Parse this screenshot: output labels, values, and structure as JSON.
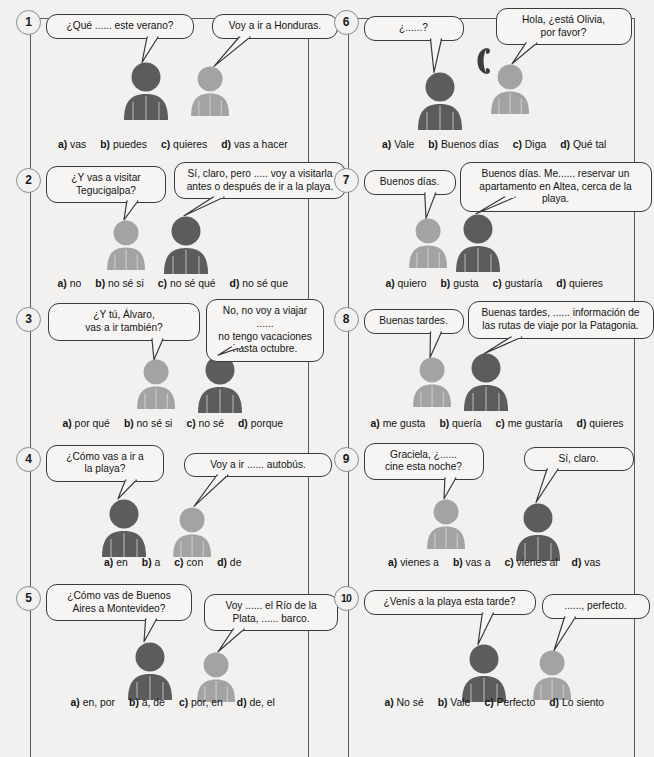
{
  "page": {
    "columns": 2,
    "colors": {
      "background": "#f2f1ef",
      "frame": "#5a5a5a",
      "bubble_border": "#3a3a3a",
      "person_dark": "#5c5c5c",
      "person_light": "#a3a3a3",
      "number_circle_border": "#8a8a8a"
    }
  },
  "items": [
    {
      "number": "1",
      "left_bubble": "¿Qué ...... este verano?",
      "right_bubble": "Voy a ir a Honduras.",
      "left_person": "dark",
      "right_person": "light",
      "has_phone": false,
      "options": [
        {
          "letter": "a)",
          "text": "vas"
        },
        {
          "letter": "b)",
          "text": "puedes"
        },
        {
          "letter": "c)",
          "text": "quieres"
        },
        {
          "letter": "d)",
          "text": "vas a hacer"
        }
      ]
    },
    {
      "number": "2",
      "left_bubble": "¿Y vas a visitar\nTegucigalpa?",
      "right_bubble": "Sí, claro, pero ..... voy a visitarla\nantes o después de ir a la playa.",
      "left_person": "light",
      "right_person": "dark",
      "has_phone": false,
      "options": [
        {
          "letter": "a)",
          "text": "no"
        },
        {
          "letter": "b)",
          "text": "no sé si"
        },
        {
          "letter": "c)",
          "text": "no sé qué"
        },
        {
          "letter": "d)",
          "text": "no sé que"
        }
      ]
    },
    {
      "number": "3",
      "left_bubble": "¿Y tú, Álvaro,\nvas a ir también?",
      "right_bubble": "No, no voy a viajar ......\nno tengo vacaciones\nhasta octubre.",
      "left_person": "light",
      "right_person": "dark",
      "has_phone": false,
      "options": [
        {
          "letter": "a)",
          "text": "por qué"
        },
        {
          "letter": "b)",
          "text": "no sé si"
        },
        {
          "letter": "c)",
          "text": "no sé"
        },
        {
          "letter": "d)",
          "text": "porque"
        }
      ]
    },
    {
      "number": "4",
      "left_bubble": "¿Cómo vas a ir a\nla playa?",
      "right_bubble": "Voy a ir ...... autobús.",
      "left_person": "dark",
      "right_person": "light",
      "has_phone": false,
      "options": [
        {
          "letter": "a)",
          "text": "en"
        },
        {
          "letter": "b)",
          "text": "a"
        },
        {
          "letter": "c)",
          "text": "con"
        },
        {
          "letter": "d)",
          "text": "de"
        }
      ]
    },
    {
      "number": "5",
      "left_bubble": "¿Cómo vas de Buenos\nAires a Montevideo?",
      "right_bubble": "Voy ...... el Río de la\nPlata, ...... barco.",
      "left_person": "dark",
      "right_person": "light",
      "has_phone": false,
      "options": [
        {
          "letter": "a)",
          "text": "en, por"
        },
        {
          "letter": "b)",
          "text": "a, de"
        },
        {
          "letter": "c)",
          "text": "por, en"
        },
        {
          "letter": "d)",
          "text": "de, el"
        }
      ]
    },
    {
      "number": "6",
      "left_bubble": "¿......?",
      "right_bubble": "Hola, ¿está Olivia,\npor favor?",
      "left_person": "dark",
      "right_person": "light",
      "has_phone": true,
      "phone_icon": "telephone-handset-icon",
      "options": [
        {
          "letter": "a)",
          "text": "Vale"
        },
        {
          "letter": "b)",
          "text": "Buenos días"
        },
        {
          "letter": "c)",
          "text": "Diga"
        },
        {
          "letter": "d)",
          "text": "Qué tal"
        }
      ]
    },
    {
      "number": "7",
      "left_bubble": "Buenos días.",
      "right_bubble": "Buenos días. Me...... reservar un\napartamento en Altea, cerca de la playa.",
      "left_person": "light",
      "right_person": "dark",
      "has_phone": false,
      "options": [
        {
          "letter": "a)",
          "text": "quiero"
        },
        {
          "letter": "b)",
          "text": "gusta"
        },
        {
          "letter": "c)",
          "text": "gustaría"
        },
        {
          "letter": "d)",
          "text": "quieres"
        }
      ]
    },
    {
      "number": "8",
      "left_bubble": "Buenas tardes.",
      "right_bubble": "Buenas tardes, ...... información de\nlas rutas de viaje por la Patagonia.",
      "left_person": "light",
      "right_person": "dark",
      "has_phone": false,
      "options": [
        {
          "letter": "a)",
          "text": "me gusta"
        },
        {
          "letter": "b)",
          "text": "quería"
        },
        {
          "letter": "c)",
          "text": "me gustaría"
        },
        {
          "letter": "d)",
          "text": "quieres"
        }
      ]
    },
    {
      "number": "9",
      "left_bubble": "Graciela, ¿......\ncine esta noche?",
      "right_bubble": "Sí, claro.",
      "left_person": "light",
      "right_person": "dark",
      "has_phone": false,
      "options": [
        {
          "letter": "a)",
          "text": "vienes a"
        },
        {
          "letter": "b)",
          "text": "vas a"
        },
        {
          "letter": "c)",
          "text": "vienes al"
        },
        {
          "letter": "d)",
          "text": "vas"
        }
      ]
    },
    {
      "number": "10",
      "left_bubble": "¿Venís a la playa esta tarde?",
      "right_bubble": "......, perfecto.",
      "left_person": "dark",
      "right_person": "light",
      "has_phone": false,
      "options": [
        {
          "letter": "a)",
          "text": "No sé"
        },
        {
          "letter": "b)",
          "text": "Vale"
        },
        {
          "letter": "c)",
          "text": "Perfecto"
        },
        {
          "letter": "d)",
          "text": "Lo siento"
        }
      ]
    }
  ],
  "layout": {
    "item_specs": [
      {
        "lb": {
          "l": 0,
          "t": 14,
          "w": 148,
          "align": "center"
        },
        "rb": {
          "l": 166,
          "t": 14,
          "w": 126
        },
        "ld": {
          "x": 96,
          "y": 62
        },
        "rd": {
          "x": 168,
          "y": 66
        },
        "lp": {
          "x": 72,
          "y": 62,
          "s": 1.0
        },
        "rp": {
          "x": 140,
          "y": 66,
          "s": 0.86
        }
      },
      {
        "lb": {
          "l": 0,
          "t": 8,
          "w": 120
        },
        "rb": {
          "l": 128,
          "t": 4,
          "w": 172
        },
        "ld": {
          "x": 78,
          "y": 62
        },
        "rd": {
          "x": 138,
          "y": 58
        },
        "lp": {
          "x": 56,
          "y": 62,
          "s": 0.86
        },
        "rp": {
          "x": 112,
          "y": 58,
          "s": 1.0
        }
      },
      {
        "lb": {
          "l": 2,
          "t": 6,
          "w": 152
        },
        "rb": {
          "l": 160,
          "t": 2,
          "w": 118
        },
        "ld": {
          "x": 108,
          "y": 62
        },
        "rd": {
          "x": 172,
          "y": 58
        },
        "lp": {
          "x": 86,
          "y": 62,
          "s": 0.86
        },
        "rp": {
          "x": 146,
          "y": 58,
          "s": 1.0
        }
      },
      {
        "lb": {
          "l": 0,
          "t": 8,
          "w": 118
        },
        "rb": {
          "l": 138,
          "t": 16,
          "w": 148
        },
        "ld": {
          "x": 72,
          "y": 62
        },
        "rd": {
          "x": 148,
          "y": 70
        },
        "lp": {
          "x": 50,
          "y": 62,
          "s": 1.0
        },
        "rp": {
          "x": 122,
          "y": 70,
          "s": 0.86
        }
      },
      {
        "lb": {
          "l": 0,
          "t": 8,
          "w": 146
        },
        "rb": {
          "l": 158,
          "t": 18,
          "w": 134
        },
        "ld": {
          "x": 98,
          "y": 66
        },
        "rd": {
          "x": 172,
          "y": 76
        },
        "lp": {
          "x": 76,
          "y": 66,
          "s": 1.0
        },
        "rp": {
          "x": 146,
          "y": 76,
          "s": 0.86
        }
      },
      {
        "lb": {
          "l": 0,
          "t": 16,
          "w": 100
        },
        "rb": {
          "l": 132,
          "t": 8,
          "w": 136
        },
        "ld": {
          "x": 70,
          "y": 72
        },
        "rd": {
          "x": 148,
          "y": 64
        },
        "lp": {
          "x": 48,
          "y": 72,
          "s": 1.0
        },
        "rp": {
          "x": 122,
          "y": 64,
          "s": 0.86
        }
      },
      {
        "lb": {
          "l": 0,
          "t": 12,
          "w": 92
        },
        "rb": {
          "l": 96,
          "t": 4,
          "w": 192
        },
        "ld": {
          "x": 62,
          "y": 60
        },
        "rd": {
          "x": 112,
          "y": 56
        },
        "lp": {
          "x": 40,
          "y": 60,
          "s": 0.86
        },
        "rp": {
          "x": 86,
          "y": 56,
          "s": 1.0
        }
      },
      {
        "lb": {
          "l": 0,
          "t": 12,
          "w": 100
        },
        "rb": {
          "l": 104,
          "t": 4,
          "w": 186
        },
        "ld": {
          "x": 66,
          "y": 60
        },
        "rd": {
          "x": 120,
          "y": 56
        },
        "lp": {
          "x": 44,
          "y": 60,
          "s": 0.86
        },
        "rp": {
          "x": 94,
          "y": 56,
          "s": 1.0
        }
      },
      {
        "lb": {
          "l": 0,
          "t": 6,
          "w": 120
        },
        "rb": {
          "l": 160,
          "t": 10,
          "w": 110
        },
        "ld": {
          "x": 80,
          "y": 62
        },
        "rd": {
          "x": 172,
          "y": 66
        },
        "lp": {
          "x": 58,
          "y": 62,
          "s": 0.86
        },
        "rp": {
          "x": 146,
          "y": 66,
          "s": 1.0
        }
      },
      {
        "lb": {
          "l": 0,
          "t": 14,
          "w": 172
        },
        "rb": {
          "l": 178,
          "t": 18,
          "w": 108
        },
        "ld": {
          "x": 114,
          "y": 68
        },
        "rd": {
          "x": 190,
          "y": 74
        },
        "lp": {
          "x": 92,
          "y": 68,
          "s": 1.0
        },
        "rp": {
          "x": 164,
          "y": 74,
          "s": 0.86
        }
      }
    ]
  }
}
